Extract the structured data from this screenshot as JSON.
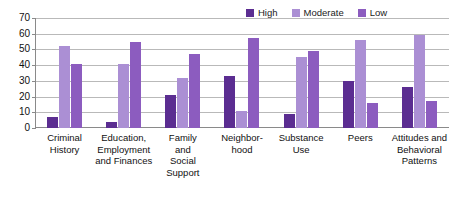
{
  "chart_data": {
    "type": "bar",
    "title": "",
    "xlabel": "",
    "ylabel": "",
    "ylim": [
      0,
      70
    ],
    "y_ticks": [
      70,
      60,
      50,
      40,
      30,
      20,
      10,
      0
    ],
    "grid": true,
    "legend_position": "top-right",
    "categories": [
      "Criminal History",
      "Education, Employment and Finances",
      "Family and Social Support",
      "Neighborhood",
      "Substance Use",
      "Peers",
      "Attitudes and Behavioral Patterns"
    ],
    "category_lines": [
      [
        "Criminal",
        "History"
      ],
      [
        "Education,",
        "Employment",
        "and Finances"
      ],
      [
        "Family",
        "and",
        "Social",
        "Support"
      ],
      [
        "Neighbor-",
        "hood"
      ],
      [
        "Substance",
        "Use"
      ],
      [
        "Peers"
      ],
      [
        "Attitudes and",
        "Behavioral",
        "Patterns"
      ]
    ],
    "series": [
      {
        "name": "High",
        "color": "#5b2d91",
        "values": [
          7,
          4,
          21,
          33,
          9,
          30,
          26
        ]
      },
      {
        "name": "Moderate",
        "color": "#ab8fd4",
        "values": [
          52,
          41,
          32,
          11,
          45,
          56,
          59
        ]
      },
      {
        "name": "Low",
        "color": "#8c5cbf",
        "values": [
          41,
          55,
          47,
          57,
          49,
          16,
          17
        ]
      }
    ]
  },
  "legend": {
    "entries": [
      {
        "label": "High",
        "color": "#5b2d91"
      },
      {
        "label": "Moderate",
        "color": "#ab8fd4"
      },
      {
        "label": "Low",
        "color": "#8c5cbf"
      }
    ]
  },
  "axis": {
    "y_labels": [
      "70",
      "60",
      "50",
      "40",
      "30",
      "20",
      "10",
      "0"
    ]
  }
}
